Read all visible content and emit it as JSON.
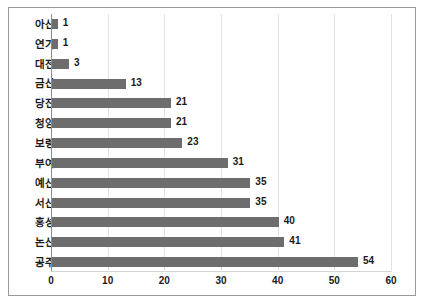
{
  "chart_data": {
    "type": "bar",
    "orientation": "horizontal",
    "title": "",
    "xlabel": "",
    "ylabel": "",
    "xlim": [
      0,
      60
    ],
    "xticks": [
      0,
      10,
      20,
      30,
      40,
      50,
      60
    ],
    "grid": "vertical",
    "legend": "none",
    "bar_color": "#6d6d6d",
    "categories": [
      "아산",
      "연기",
      "대전",
      "금산",
      "당진",
      "청양",
      "보령",
      "부여",
      "예산",
      "서산",
      "홍성",
      "논산",
      "공주"
    ],
    "values": [
      1,
      1,
      3,
      13,
      21,
      21,
      23,
      31,
      35,
      35,
      40,
      41,
      54
    ],
    "data_labels": [
      "1",
      "1",
      "3",
      "13",
      "21",
      "21",
      "23",
      "31",
      "35",
      "35",
      "40",
      "41",
      "54"
    ],
    "tick_labels": [
      "0",
      "10",
      "20",
      "30",
      "40",
      "50",
      "60"
    ]
  }
}
